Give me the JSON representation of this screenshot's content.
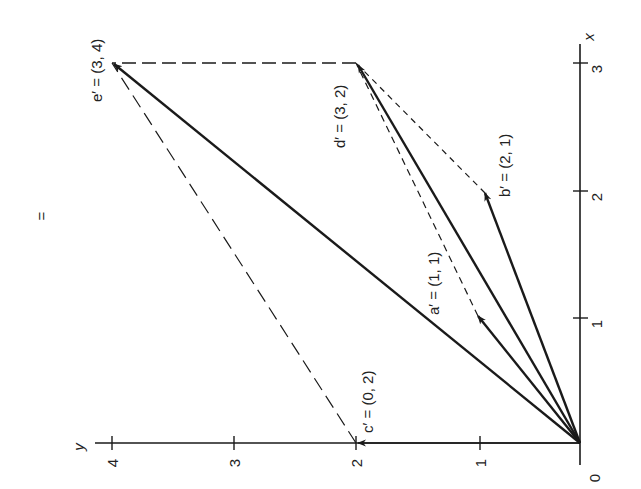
{
  "diagram": {
    "title_symbol": "=",
    "axes": {
      "x_label": "x",
      "y_label": "y",
      "origin_label": "0",
      "x_ticks": [
        "1",
        "2",
        "3"
      ],
      "y_ticks": [
        "1",
        "2",
        "3",
        "4"
      ]
    },
    "vectors": [
      {
        "name": "a'",
        "label": "a′ = (1, 1)",
        "x": 1,
        "y": 1
      },
      {
        "name": "b'",
        "label": "b′ = (2, 1)",
        "x": 2,
        "y": 1
      },
      {
        "name": "c'",
        "label": "c′ = (0, 2)",
        "x": 0,
        "y": 2
      },
      {
        "name": "d'",
        "label": "d′ = (3, 2)",
        "x": 3,
        "y": 2
      },
      {
        "name": "e'",
        "label": "e′ = (3, 4)",
        "x": 3,
        "y": 4
      }
    ],
    "dashed_connectors": [
      {
        "from": "a'",
        "to": "d'"
      },
      {
        "from": "b'",
        "to": "d'"
      },
      {
        "from": "d'",
        "to": "e'"
      },
      {
        "from": "c'",
        "to": "e'"
      }
    ],
    "line_color": "#1a1a1a",
    "orientation": "rotated 90° counter-clockwise (x-axis points up, y-axis points left)"
  }
}
